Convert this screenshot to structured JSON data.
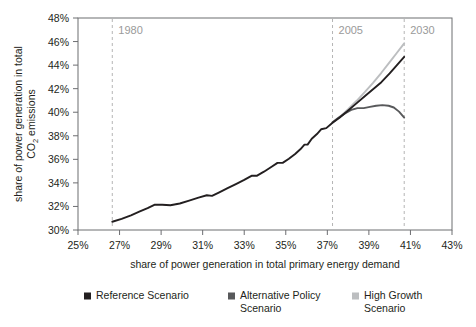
{
  "chart_data": {
    "type": "line",
    "title": "",
    "xlabel": "share of power generation in total primary energy demand",
    "ylabel_line1": "share of power generation in total",
    "ylabel_line2": "CO",
    "ylabel_sub": "2",
    "ylabel_line2b": " emissions",
    "xlim": [
      25,
      43
    ],
    "ylim": [
      30,
      48
    ],
    "xticks": [
      "25%",
      "27%",
      "29%",
      "31%",
      "33%",
      "35%",
      "37%",
      "39%",
      "41%",
      "43%"
    ],
    "xtick_values": [
      25,
      27,
      29,
      31,
      33,
      35,
      37,
      39,
      41,
      43
    ],
    "yticks": [
      "30%",
      "32%",
      "34%",
      "36%",
      "38%",
      "40%",
      "42%",
      "44%",
      "46%",
      "48%"
    ],
    "ytick_values": [
      30,
      32,
      34,
      36,
      38,
      40,
      42,
      44,
      46,
      48
    ],
    "grid": false,
    "legend_position": "bottom",
    "annotations": [
      {
        "label": "1980",
        "x": 26.65,
        "type": "vertical-dashed-line"
      },
      {
        "label": "2005",
        "x": 37.25,
        "type": "vertical-dashed-line"
      },
      {
        "label": "2030",
        "x": 40.7,
        "type": "vertical-dashed-line"
      }
    ],
    "series": [
      {
        "name": "Reference Scenario",
        "color": "#231f20",
        "points": [
          [
            26.65,
            30.7
          ],
          [
            27.1,
            30.95
          ],
          [
            27.55,
            31.25
          ],
          [
            27.95,
            31.55
          ],
          [
            28.35,
            31.85
          ],
          [
            28.7,
            32.15
          ],
          [
            29.05,
            32.15
          ],
          [
            29.45,
            32.1
          ],
          [
            29.9,
            32.25
          ],
          [
            30.35,
            32.5
          ],
          [
            30.8,
            32.75
          ],
          [
            31.2,
            32.95
          ],
          [
            31.45,
            32.9
          ],
          [
            31.8,
            33.2
          ],
          [
            32.2,
            33.55
          ],
          [
            32.6,
            33.9
          ],
          [
            33.0,
            34.25
          ],
          [
            33.35,
            34.6
          ],
          [
            33.6,
            34.6
          ],
          [
            33.95,
            34.95
          ],
          [
            34.3,
            35.35
          ],
          [
            34.6,
            35.7
          ],
          [
            34.85,
            35.7
          ],
          [
            35.15,
            36.05
          ],
          [
            35.45,
            36.45
          ],
          [
            35.7,
            36.85
          ],
          [
            35.9,
            37.25
          ],
          [
            36.05,
            37.25
          ],
          [
            36.25,
            37.75
          ],
          [
            36.5,
            38.15
          ],
          [
            36.7,
            38.55
          ],
          [
            36.95,
            38.65
          ],
          [
            37.25,
            39.1
          ],
          [
            37.6,
            39.55
          ],
          [
            38.0,
            40.15
          ],
          [
            38.4,
            40.75
          ],
          [
            38.8,
            41.35
          ],
          [
            39.2,
            41.95
          ],
          [
            39.6,
            42.55
          ],
          [
            40.0,
            43.3
          ],
          [
            40.35,
            44.0
          ],
          [
            40.7,
            44.7
          ]
        ]
      },
      {
        "name": "Alternative Policy Scenario",
        "color": "#58595b",
        "points": [
          [
            37.25,
            39.15
          ],
          [
            37.55,
            39.55
          ],
          [
            37.85,
            39.9
          ],
          [
            38.15,
            40.2
          ],
          [
            38.45,
            40.35
          ],
          [
            38.75,
            40.35
          ],
          [
            39.05,
            40.45
          ],
          [
            39.35,
            40.55
          ],
          [
            39.65,
            40.6
          ],
          [
            39.95,
            40.55
          ],
          [
            40.2,
            40.4
          ],
          [
            40.45,
            40.05
          ],
          [
            40.7,
            39.55
          ]
        ]
      },
      {
        "name": "High Growth Scenario",
        "color": "#bcbec0",
        "points": [
          [
            37.25,
            39.1
          ],
          [
            37.6,
            39.6
          ],
          [
            38.0,
            40.25
          ],
          [
            38.4,
            40.95
          ],
          [
            38.8,
            41.7
          ],
          [
            39.2,
            42.5
          ],
          [
            39.6,
            43.35
          ],
          [
            40.0,
            44.25
          ],
          [
            40.35,
            45.05
          ],
          [
            40.7,
            45.85
          ]
        ]
      }
    ],
    "legend": [
      {
        "label_line1": "Reference Scenario",
        "label_line2": "",
        "color": "#231f20"
      },
      {
        "label_line1": "Alternative Policy",
        "label_line2": "Scenario",
        "color": "#58595b"
      },
      {
        "label_line1": "High Growth",
        "label_line2": "Scenario",
        "color": "#bcbec0"
      }
    ]
  },
  "colors": {
    "axis": "#6d6e71",
    "dashed": "#b5b5b5",
    "text": "#231f20",
    "year_text": "#9a9a9a",
    "background": "#ffffff"
  }
}
